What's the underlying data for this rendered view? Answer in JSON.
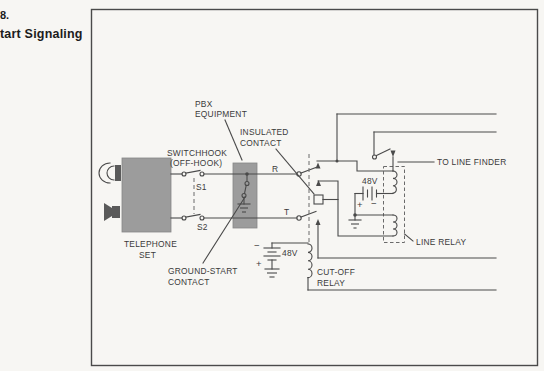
{
  "colors": {
    "paper": "#f7f6f3",
    "line": "#4a4a4a",
    "dash": "#6a6a6a",
    "blockgray": "#9c9c9c",
    "ink": "#3a3a3a"
  },
  "caption": {
    "line1": "8.",
    "line2": "tart Signaling"
  },
  "labels": {
    "pbx": [
      "PBX",
      "EQUIPMENT"
    ],
    "insulated": [
      "INSULATED",
      "CONTACT"
    ],
    "switchhook": [
      "SWITCHHOOK",
      "(OFF-HOOK)"
    ],
    "s1": "S1",
    "s2": "S2",
    "r": "R",
    "t": "T",
    "telephone": [
      "TELEPHONE",
      "SET"
    ],
    "ground_start": [
      "GROUND-START",
      "CONTACT"
    ],
    "cutoff": [
      "CUT-OFF",
      "RELAY"
    ],
    "line_relay": "LINE RELAY",
    "to_line_finder": "TO LINE FINDER"
  },
  "battery_left": {
    "voltage": "48V",
    "top_sign": "−",
    "bottom_sign": "+"
  },
  "battery_right": {
    "voltage": "48V",
    "left_sign": "+",
    "right_sign": "−"
  }
}
